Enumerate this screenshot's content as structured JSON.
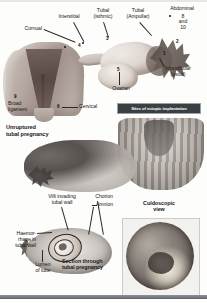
{
  "figure": {
    "title": "Sites of ectopic implantation",
    "banner_label": "Sites of ectopic implantation"
  },
  "top_diagram": {
    "name": "uterus-and-fallopian-tube-ectopic-sites",
    "labels": [
      {
        "id": "cornual",
        "text": "Cornual"
      },
      {
        "id": "interstitial",
        "text": "Interstitial"
      },
      {
        "id": "tubal-isthmic",
        "text": "Tubal\n(isthmic)"
      },
      {
        "id": "tubal-ampullar",
        "text": "Tubal\n(Ampullar)"
      },
      {
        "id": "abdominal",
        "text": "Abdominal"
      },
      {
        "id": "abdominal-nums",
        "text": "8\nand\n10"
      },
      {
        "id": "infundibular",
        "text": "Infundibular\n(ostial)"
      },
      {
        "id": "ovarian",
        "text": "Ovarian"
      },
      {
        "id": "broad-ligament",
        "text": "Broad\nligament"
      },
      {
        "id": "cervical",
        "text": "Cervical"
      }
    ],
    "markers": [
      {
        "id": "marker-1",
        "text": "1"
      },
      {
        "id": "marker-2",
        "text": "2"
      },
      {
        "id": "marker-3",
        "text": "3"
      },
      {
        "id": "marker-4",
        "text": "4"
      },
      {
        "id": "marker-5",
        "text": "5"
      },
      {
        "id": "marker-6",
        "text": "6"
      },
      {
        "id": "marker-7",
        "text": "7"
      },
      {
        "id": "marker-9",
        "text": "9"
      }
    ]
  },
  "middle_section": {
    "heading": "Unruptured\ntubal pregnancy",
    "specimen_left_name": "unruptured-tubal-pregnancy-specimen",
    "specimen_right_name": "opened-uterus-specimen"
  },
  "lower_section": {
    "labels": [
      {
        "id": "villi-invading",
        "text": "Villi invading\ntubal wall"
      },
      {
        "id": "chorion",
        "text": "Chorion"
      },
      {
        "id": "amnion",
        "text": "Amnion"
      },
      {
        "id": "haemorrhage",
        "text": "Haemor-\nrhage in\ntubal wall"
      },
      {
        "id": "lumen-of-tube",
        "text": "Lumen\nof tube"
      }
    ],
    "caption": "Section through\ntubal pregnancy",
    "culdoscopic_caption": "Culdoscopic\nview"
  },
  "colors": {
    "banner_bg": "#3a3f42",
    "banner_text": "#ffffff",
    "page_bg": "#fdfdfb",
    "label_text": "#17171a"
  }
}
